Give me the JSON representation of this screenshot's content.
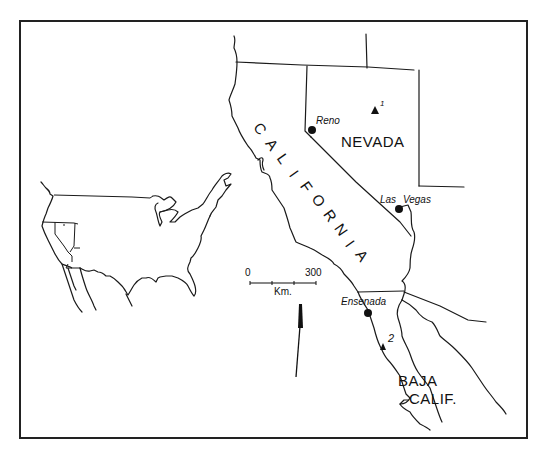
{
  "map": {
    "states": {
      "california": "CALIFORNIA",
      "california_letters": [
        "C",
        "A",
        "L",
        "I",
        "F",
        "O",
        "R",
        "N",
        "I",
        "A"
      ],
      "nevada": "NEVADA",
      "baja_line1": "BAJA",
      "baja_line2": "CALIF."
    },
    "cities": [
      {
        "name": "Reno"
      },
      {
        "name": "Las Vegas"
      },
      {
        "name": "Ensenada"
      }
    ],
    "sites": [
      {
        "label": "1"
      },
      {
        "label": "2"
      }
    ],
    "scale_bar": {
      "start": "0",
      "end": "300",
      "unit": "Km."
    },
    "colors": {
      "ink": "#1a1a1a",
      "background": "#ffffff"
    }
  }
}
